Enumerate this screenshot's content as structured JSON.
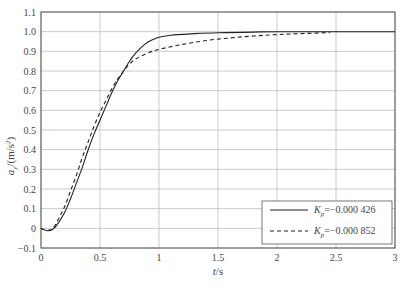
{
  "chart_data": {
    "type": "line",
    "title": "",
    "xlabel": "t/s",
    "ylabel": "a_y/(m/s^2)",
    "xlim": [
      0,
      3
    ],
    "ylim": [
      -0.1,
      1.1
    ],
    "xticks": [
      0,
      0.5,
      1,
      1.5,
      2,
      2.5,
      3
    ],
    "xtick_labels": [
      "0",
      "0.5",
      "1",
      "1.5",
      "2",
      "2.5",
      "3"
    ],
    "yticks": [
      -0.1,
      0,
      0.1,
      0.2,
      0.3,
      0.4,
      0.5,
      0.6,
      0.7,
      0.8,
      0.9,
      1.0,
      1.1
    ],
    "ytick_labels": [
      "−0.1",
      "0",
      "0.1",
      "0.2",
      "0.3",
      "0.4",
      "0.5",
      "0.6",
      "0.7",
      "0.8",
      "0.9",
      "1.0",
      "1.1"
    ],
    "grid": true,
    "legend_position": "lower right",
    "series": [
      {
        "name": "K_p=−0.000 426",
        "legend_label": "=−0.000 426",
        "style": "solid",
        "x": [
          0,
          0.05,
          0.1,
          0.15,
          0.2,
          0.25,
          0.3,
          0.35,
          0.4,
          0.45,
          0.5,
          0.55,
          0.6,
          0.65,
          0.7,
          0.75,
          0.8,
          0.85,
          0.9,
          0.95,
          1.0,
          1.1,
          1.2,
          1.3,
          1.5,
          1.8,
          2.0,
          2.5,
          3.0
        ],
        "y": [
          0,
          -0.012,
          -0.005,
          0.03,
          0.08,
          0.15,
          0.23,
          0.31,
          0.4,
          0.48,
          0.55,
          0.62,
          0.69,
          0.75,
          0.8,
          0.85,
          0.89,
          0.92,
          0.945,
          0.96,
          0.972,
          0.982,
          0.986,
          0.99,
          0.995,
          0.998,
          1.0,
          1.0,
          1.0
        ]
      },
      {
        "name": "K_p=−0.000 852",
        "legend_label": "=−0.000 852",
        "style": "dashed",
        "x": [
          0,
          0.05,
          0.1,
          0.15,
          0.2,
          0.25,
          0.3,
          0.35,
          0.4,
          0.45,
          0.5,
          0.55,
          0.6,
          0.65,
          0.7,
          0.75,
          0.8,
          0.9,
          1.0,
          1.2,
          1.4,
          1.6,
          1.8,
          2.0,
          2.2,
          2.45
        ],
        "y": [
          0,
          -0.01,
          0.0,
          0.05,
          0.11,
          0.19,
          0.27,
          0.36,
          0.44,
          0.52,
          0.59,
          0.65,
          0.71,
          0.76,
          0.8,
          0.835,
          0.86,
          0.89,
          0.91,
          0.935,
          0.955,
          0.968,
          0.978,
          0.985,
          0.99,
          0.995
        ]
      }
    ]
  },
  "axes": {
    "xlabel_italic": "t",
    "xlabel_unit": "/s",
    "ylabel_var": "a",
    "ylabel_sub": "y",
    "ylabel_unit": "/(m/s",
    "ylabel_sup": "2",
    "ylabel_close": ")"
  },
  "legend": {
    "items": [
      {
        "symbol": "K",
        "sub": "p",
        "value": "=−0.000 426",
        "style": "solid"
      },
      {
        "symbol": "K",
        "sub": "p",
        "value": "=−0.000 852",
        "style": "dashed"
      }
    ]
  }
}
